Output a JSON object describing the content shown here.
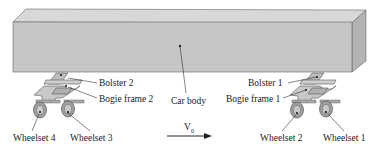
{
  "diagram": {
    "type": "railway vehicle schematic",
    "labels": {
      "car_body": "Car body",
      "bolster_1": "Bolster 1",
      "bolster_2": "Bolster 2",
      "bogie_frame_1": "Bogie frame 1",
      "bogie_frame_2": "Bogie frame 2",
      "wheelset_1": "Wheelset 1",
      "wheelset_2": "Wheelset 2",
      "wheelset_3": "Wheelset 3",
      "wheelset_4": "Wheelset 4",
      "velocity_symbol": "V",
      "velocity_subscript": "0"
    },
    "colors": {
      "body_front": "#c4c4c4",
      "body_top": "#d6d6d6",
      "body_side": "#b4b4b4",
      "outline": "#555555",
      "text": "#222222"
    },
    "velocity_direction": "right"
  }
}
